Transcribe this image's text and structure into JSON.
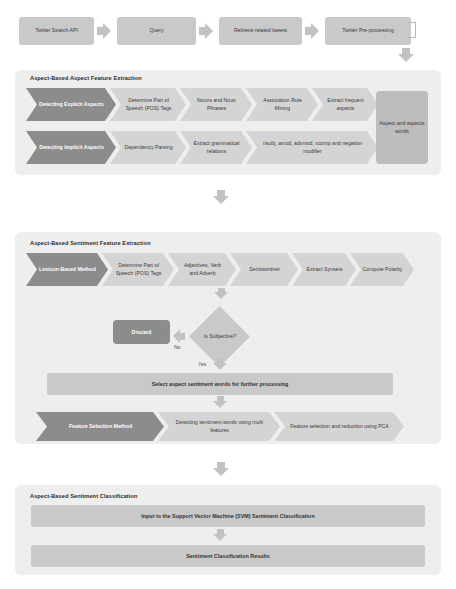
{
  "diagram": {
    "colors": {
      "panel_bg": "#eeeeee",
      "stage_fill": "#c9c9c9",
      "chevron_dark": "#8c8c8c",
      "chevron_light": "#d4d4d4",
      "arrow": "#c2c2c2",
      "text": "#3a3a3a"
    }
  },
  "top_row": {
    "steps": [
      {
        "label": "Twitter Search API"
      },
      {
        "label": "Query"
      },
      {
        "label": "Retrieve related tweets"
      },
      {
        "label": "Twitter Pre-processing"
      }
    ]
  },
  "aspect_section": {
    "title": "Aspect-Based Aspect Feature Extraction",
    "explicit_row": [
      {
        "label": "Detecting Explicit Aspects",
        "style": "dark"
      },
      {
        "label": "Determine Part of Speech (POS) Tags",
        "style": "light"
      },
      {
        "label": "Nouns and Noun Phrases",
        "style": "light"
      },
      {
        "label": "Association Rule Mining",
        "style": "light"
      },
      {
        "label": "Extract frequent aspects",
        "style": "light"
      }
    ],
    "implicit_row": [
      {
        "label": "Detecting Implicit Aspects",
        "style": "dark"
      },
      {
        "label": "Dependency Parsing",
        "style": "light"
      },
      {
        "label": "Extract grammatical relations",
        "style": "light"
      },
      {
        "label": "nsubj, amod, advmod, xcomp and negation modifier",
        "style": "light"
      }
    ],
    "output_box": {
      "label": "Aspect and aspects words"
    }
  },
  "sentiment_section": {
    "title": "Aspect-Based Sentiment Feature Extraction",
    "lexicon_row": [
      {
        "label": "Lexicon-Based Method",
        "style": "dark"
      },
      {
        "label": "Determine Part of Speech (POS) Tags",
        "style": "light"
      },
      {
        "label": "Adjectives, Verb and Adverb",
        "style": "light"
      },
      {
        "label": "Sentiwordnet",
        "style": "light"
      },
      {
        "label": "Extract Synsets",
        "style": "light"
      },
      {
        "label": "Compute Polarity",
        "style": "light"
      }
    ],
    "decision": {
      "label": "Is Subjective?"
    },
    "discard": {
      "label": "Discard"
    },
    "edge_no": "No",
    "edge_yes": "Yes",
    "select_bar": {
      "label": "Select aspect sentiment words for further processing"
    },
    "feature_row": [
      {
        "label": "Feature Selection Method",
        "style": "dark"
      },
      {
        "label": "Detecting sentiment words using multi features",
        "style": "light"
      },
      {
        "label": "Feature selection and reduction using PCA",
        "style": "light"
      }
    ]
  },
  "classification_section": {
    "title": "Aspect-Based Sentiment Classification",
    "bars": [
      {
        "label": "Input to the Support Vector Machine (SVM) Sentiment Classification"
      },
      {
        "label": "Sentiment Classification Results"
      }
    ]
  }
}
